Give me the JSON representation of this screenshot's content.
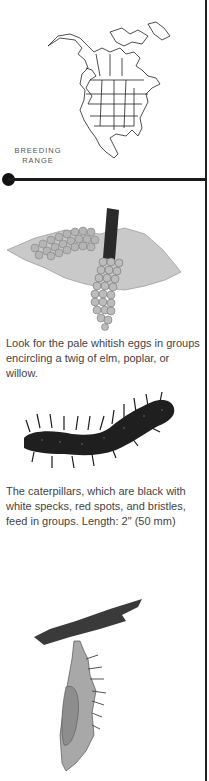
{
  "map": {
    "label_line1": "BREEDING",
    "label_line2": "RANGE",
    "icon": "north-america-map"
  },
  "stages": [
    {
      "illustration": "egg-cluster-on-twig",
      "caption": "Look for the pale whitish eggs in groups encircling a twig of elm, poplar, or willow."
    },
    {
      "illustration": "spiny-black-caterpillar",
      "caption": "The caterpillars, which are black with white specks, red spots, and bristles, feed in groups. Length: 2\" (50 mm)"
    },
    {
      "illustration": "hanging-chrysalis",
      "caption": ""
    }
  ]
}
